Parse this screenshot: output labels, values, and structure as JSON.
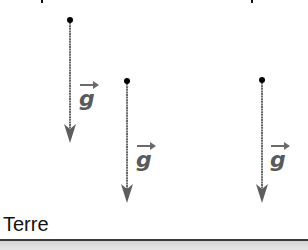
{
  "diagram": {
    "ground_label": "Terre",
    "vector_symbol": "g",
    "colors": {
      "vector_line": "#6a6a6a",
      "point": "#000000",
      "label": "#5a5a5a",
      "ground_line": "#3a3a3a",
      "ground_fill": "#dcdcdc"
    },
    "vectors": [
      {
        "id": "g1",
        "label": "g",
        "origin": [
          70,
          20
        ],
        "tip": [
          70,
          142
        ],
        "label_pos": [
          80,
          87
        ]
      },
      {
        "id": "g2",
        "label": "g",
        "origin": [
          127,
          81
        ],
        "tip": [
          127,
          202
        ],
        "label_pos": [
          137,
          148
        ]
      },
      {
        "id": "g3",
        "label": "g",
        "origin": [
          262,
          80
        ],
        "tip": [
          262,
          202
        ],
        "label_pos": [
          270,
          148
        ]
      }
    ]
  }
}
